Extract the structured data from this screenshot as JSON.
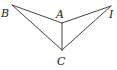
{
  "diagram": {
    "type": "geometry-figure",
    "points": [
      {
        "id": "B",
        "label": "B",
        "x": 12,
        "y": 5,
        "label_x": 1,
        "label_y": 17
      },
      {
        "id": "A",
        "label": "A",
        "x": 62,
        "y": 23,
        "label_x": 56,
        "label_y": 18
      },
      {
        "id": "I",
        "label": "I",
        "x": 111,
        "y": 6,
        "label_x": 110,
        "label_y": 18
      },
      {
        "id": "C",
        "label": "C",
        "x": 62,
        "y": 50,
        "label_x": 57,
        "label_y": 65
      }
    ],
    "segments": [
      {
        "from": "B",
        "to": "A"
      },
      {
        "from": "A",
        "to": "I"
      },
      {
        "from": "B",
        "to": "C"
      },
      {
        "from": "I",
        "to": "C"
      },
      {
        "from": "A",
        "to": "C"
      }
    ],
    "colors": {
      "line": "#444444",
      "text": "#222222",
      "background": "#ffffff"
    }
  }
}
